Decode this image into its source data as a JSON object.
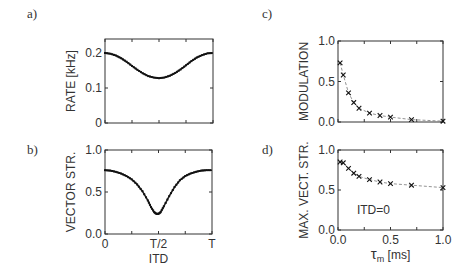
{
  "panels": {
    "a": {
      "label": "a)"
    },
    "b": {
      "label": "b)"
    },
    "c": {
      "label": "c)"
    },
    "d": {
      "label": "d)"
    }
  },
  "chart_data": [
    {
      "id": "a",
      "type": "line",
      "marker": "dot",
      "title": "",
      "xlabel": "",
      "ylabel": "RATE [kHz]",
      "xlim": [
        0,
        1
      ],
      "ylim": [
        0,
        0.24
      ],
      "xticks": [
        0,
        0.25,
        0.5,
        0.75,
        1
      ],
      "xtick_labels": [
        "",
        "",
        "",
        "",
        ""
      ],
      "yticks": [
        0,
        0.1,
        0.2
      ],
      "ytick_labels": [
        "0",
        "0.1",
        "0.2"
      ],
      "x_unit": "T",
      "x": [
        0,
        0.05,
        0.1,
        0.15,
        0.2,
        0.25,
        0.3,
        0.35,
        0.4,
        0.45,
        0.5,
        0.55,
        0.6,
        0.65,
        0.7,
        0.75,
        0.8,
        0.85,
        0.9,
        0.95,
        1.0
      ],
      "y": [
        0.2,
        0.198,
        0.193,
        0.185,
        0.175,
        0.163,
        0.152,
        0.142,
        0.134,
        0.13,
        0.128,
        0.13,
        0.135,
        0.143,
        0.153,
        0.165,
        0.177,
        0.187,
        0.194,
        0.199,
        0.2
      ],
      "grid": false
    },
    {
      "id": "b",
      "type": "line",
      "marker": "dot",
      "title": "",
      "xlabel": "ITD",
      "ylabel": "VECTOR STR.",
      "xlim": [
        0,
        1
      ],
      "ylim": [
        0,
        1.0
      ],
      "xticks": [
        0,
        0.25,
        0.5,
        0.75,
        1
      ],
      "xtick_labels": [
        "0",
        "",
        "T/2",
        "",
        "T"
      ],
      "yticks": [
        0,
        0.5,
        1.0
      ],
      "ytick_labels": [
        "0.0",
        "0.5",
        "1.0"
      ],
      "x": [
        0,
        0.05,
        0.1,
        0.15,
        0.2,
        0.25,
        0.3,
        0.35,
        0.4,
        0.43,
        0.46,
        0.48,
        0.5,
        0.52,
        0.55,
        0.6,
        0.65,
        0.7,
        0.75,
        0.8,
        0.85,
        0.9,
        0.95,
        1.0
      ],
      "y": [
        0.76,
        0.755,
        0.74,
        0.72,
        0.69,
        0.65,
        0.59,
        0.51,
        0.4,
        0.32,
        0.26,
        0.24,
        0.24,
        0.26,
        0.33,
        0.45,
        0.56,
        0.64,
        0.69,
        0.72,
        0.74,
        0.755,
        0.76,
        0.76
      ],
      "grid": false
    },
    {
      "id": "c",
      "type": "scatter",
      "marker": "x",
      "connect": "dashed",
      "title": "",
      "xlabel": "",
      "ylabel": "MODULATION",
      "xlim": [
        0,
        1.0
      ],
      "ylim": [
        0,
        1.0
      ],
      "xticks": [
        0,
        0.25,
        0.5,
        0.75,
        1.0
      ],
      "xtick_labels": [
        "",
        "",
        "",
        "",
        ""
      ],
      "yticks": [
        0,
        0.5,
        1.0
      ],
      "ytick_labels": [
        "0.0",
        "0.5",
        "1.0"
      ],
      "x": [
        0.02,
        0.05,
        0.1,
        0.15,
        0.2,
        0.3,
        0.4,
        0.5,
        0.7,
        1.0
      ],
      "y": [
        0.73,
        0.58,
        0.36,
        0.24,
        0.17,
        0.11,
        0.08,
        0.06,
        0.03,
        0.01
      ],
      "grid": false
    },
    {
      "id": "d",
      "type": "scatter",
      "marker": "x",
      "connect": "dashed",
      "title": "",
      "xlabel": "τm [ms]",
      "ylabel": "MAX. VECT. STR.",
      "annotation": "ITD=0",
      "xlim": [
        0,
        1.0
      ],
      "ylim": [
        0,
        1.0
      ],
      "xticks": [
        0,
        0.25,
        0.5,
        0.75,
        1.0
      ],
      "xtick_labels": [
        "0.0",
        "",
        "0.5",
        "",
        "1.0"
      ],
      "yticks": [
        0,
        0.5,
        1.0
      ],
      "ytick_labels": [
        "0.0",
        "0.5",
        "1.0"
      ],
      "x": [
        0.02,
        0.05,
        0.1,
        0.15,
        0.2,
        0.3,
        0.4,
        0.5,
        0.7,
        1.0
      ],
      "y": [
        0.85,
        0.84,
        0.77,
        0.71,
        0.67,
        0.63,
        0.6,
        0.58,
        0.56,
        0.53
      ],
      "grid": false
    }
  ]
}
